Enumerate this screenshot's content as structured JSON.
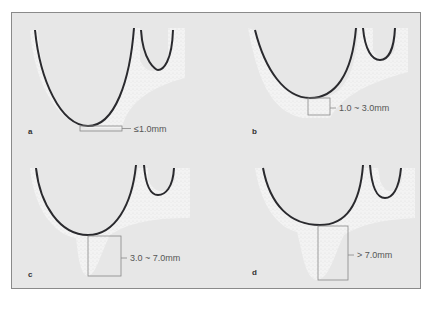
{
  "panels": [
    {
      "id": "a",
      "label": "a",
      "measurement": "≤1.0mm"
    },
    {
      "id": "b",
      "label": "b",
      "measurement": "1.0 ~ 3.0mm"
    },
    {
      "id": "c",
      "label": "c",
      "measurement": "3.0 ~ 7.0mm"
    },
    {
      "id": "d",
      "label": "d",
      "measurement": "> 7.0mm"
    }
  ],
  "colors": {
    "background": "#e7e7e7",
    "bone": "#f4f4f4",
    "root_outline": "#2a2a2e",
    "bracket": "#888888"
  }
}
